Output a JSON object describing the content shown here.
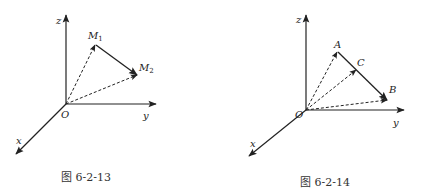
{
  "figures": [
    {
      "caption": "图 6-2-13",
      "axes": {
        "x": "x",
        "y": "y",
        "z": "z",
        "origin": "O"
      },
      "points": [
        {
          "label": "M",
          "sub": "1"
        },
        {
          "label": "M",
          "sub": "2"
        }
      ]
    },
    {
      "caption": "图 6-2-14",
      "axes": {
        "x": "x",
        "y": "y",
        "z": "z",
        "origin": "O"
      },
      "points": [
        {
          "label": "A"
        },
        {
          "label": "C"
        },
        {
          "label": "B"
        }
      ]
    }
  ]
}
